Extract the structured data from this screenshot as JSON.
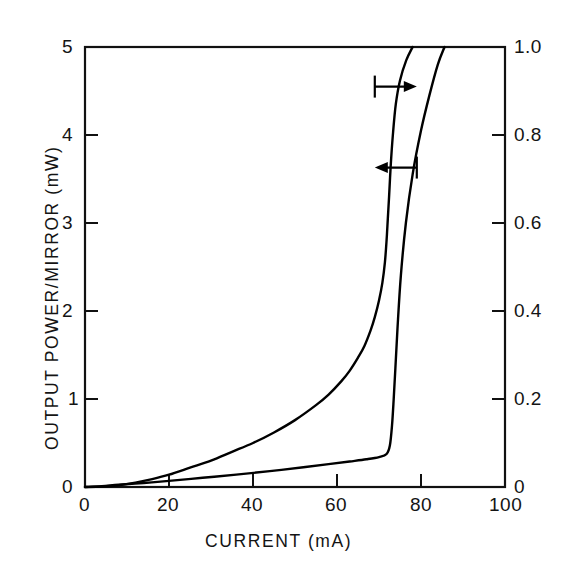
{
  "chart_data": {
    "type": "line",
    "title": "",
    "xlabel": "CURRENT (mA)",
    "ylabel": "OUTPUT POWER/MIRROR (mW)",
    "ylabel_right": "",
    "xlim": [
      0,
      100
    ],
    "ylim": [
      0,
      5
    ],
    "ylim_right": [
      0,
      1.0
    ],
    "grid": false,
    "legend": "none",
    "xticks": [
      "0",
      "20",
      "40",
      "60",
      "80",
      "100"
    ],
    "xtick_values": [
      0,
      20,
      40,
      60,
      80,
      100
    ],
    "yticks_left": [
      "0",
      "1",
      "2",
      "3",
      "4",
      "5"
    ],
    "ytick_values_left": [
      0,
      1,
      2,
      3,
      4,
      5
    ],
    "yticks_right": [
      "0",
      "0.2",
      "0.4",
      "0.6",
      "0.8",
      "1.0"
    ],
    "ytick_values_right": [
      0,
      0.2,
      0.4,
      0.6,
      0.8,
      1.0
    ],
    "series": [
      {
        "name": "output power (left axis)",
        "axis": "left",
        "x": [
          0,
          4,
          8,
          12,
          16,
          20,
          25,
          30,
          35,
          40,
          45,
          50,
          55,
          58,
          61,
          63,
          65,
          66.5,
          68,
          69,
          70,
          70.8,
          71.4,
          71.8,
          72.1,
          72.4,
          72.8,
          73.3,
          74,
          75,
          76.5,
          78
        ],
        "y": [
          0,
          0.005,
          0.02,
          0.05,
          0.09,
          0.14,
          0.22,
          0.3,
          0.4,
          0.5,
          0.62,
          0.76,
          0.93,
          1.05,
          1.2,
          1.32,
          1.47,
          1.6,
          1.78,
          1.93,
          2.12,
          2.32,
          2.55,
          2.8,
          3.05,
          3.3,
          3.66,
          4.0,
          4.35,
          4.62,
          4.85,
          5.0
        ]
      },
      {
        "name": "efficiency / second trace (right axis)",
        "axis": "right",
        "x": [
          0,
          4,
          8,
          14,
          20,
          28,
          36,
          44,
          52,
          58,
          63,
          67,
          70,
          71.8,
          72.6,
          73.1,
          73.5,
          73.9,
          74.4,
          75.2,
          76.4,
          78,
          80,
          82,
          84,
          85.6
        ],
        "y": [
          0,
          0.002,
          0.005,
          0.009,
          0.014,
          0.021,
          0.028,
          0.036,
          0.045,
          0.052,
          0.058,
          0.063,
          0.068,
          0.075,
          0.095,
          0.14,
          0.2,
          0.27,
          0.36,
          0.48,
          0.6,
          0.71,
          0.81,
          0.89,
          0.96,
          1.0
        ]
      }
    ],
    "annotations": [
      {
        "name": "right-pointing-arrow",
        "direction": "right",
        "meaning": "this curve reads on the right axis",
        "x": 74.0,
        "y_left_axis": 4.55
      },
      {
        "name": "left-pointing-arrow",
        "direction": "left",
        "meaning": "this curve reads on the left axis",
        "x": 74.0,
        "y_left_axis": 3.63
      }
    ],
    "colors": {
      "curve": "#000000",
      "axis": "#111111",
      "background": "#ffffff",
      "text": "#141414"
    }
  },
  "axes": {
    "x_title": "CURRENT (mA)",
    "y_title_left": "OUTPUT POWER/MIRROR (mW)",
    "x_tick_labels": [
      "0",
      "20",
      "40",
      "60",
      "80",
      "100"
    ],
    "y_tick_labels_left": [
      "0",
      "1",
      "2",
      "3",
      "4",
      "5"
    ],
    "y_tick_labels_right": [
      "0",
      "0.2",
      "0.4",
      "0.6",
      "0.8",
      "1.0"
    ]
  }
}
